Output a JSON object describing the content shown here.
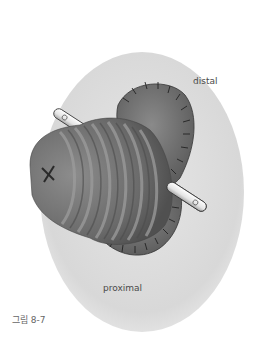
{
  "figure": {
    "labels": {
      "distal": "distal",
      "proximal": "proximal"
    },
    "caption": "그림 8-7",
    "colors": {
      "background": "#ffffff",
      "skin_ellipse": "#dcdcdc",
      "tissue_dark": "#5a5a5a",
      "tissue_mid": "#7a7a7a",
      "tissue_light": "#9a9a9a",
      "rod": "#f0f0f0",
      "outline": "#222222"
    }
  }
}
